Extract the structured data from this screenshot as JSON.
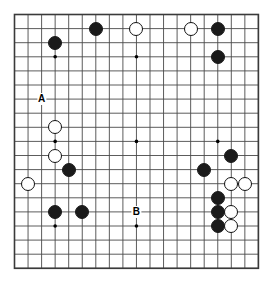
{
  "diagram": {
    "kind": "go-board-diagram",
    "board_size": 19,
    "colors": {
      "background": "#ffffff",
      "grid_line": "#4a4a4a",
      "border_line": "#3a3a3a",
      "black_stone": "#1a1a1a",
      "white_stone": "#ffffff",
      "white_stone_outline": "#111111",
      "label_text": "#000000"
    },
    "geometry": {
      "origin_x": 14.5,
      "origin_y": 14.5,
      "step_x": 13.55,
      "step_y": 14.1,
      "stone_diameter": 14,
      "border_width": 1.6,
      "grid_width": 0.9,
      "star_radius": 1.8
    },
    "star_points": [
      {
        "col": 4,
        "row": 4
      },
      {
        "col": 10,
        "row": 4
      },
      {
        "col": 16,
        "row": 4
      },
      {
        "col": 4,
        "row": 10
      },
      {
        "col": 10,
        "row": 10
      },
      {
        "col": 16,
        "row": 10
      },
      {
        "col": 4,
        "row": 16
      },
      {
        "col": 10,
        "row": 16
      },
      {
        "col": 16,
        "row": 16
      }
    ],
    "stones": [
      {
        "color": "black",
        "col": 7,
        "row": 2
      },
      {
        "color": "white",
        "col": 10,
        "row": 2
      },
      {
        "color": "white",
        "col": 14,
        "row": 2
      },
      {
        "color": "black",
        "col": 16,
        "row": 2
      },
      {
        "color": "black",
        "col": 4,
        "row": 3
      },
      {
        "color": "black",
        "col": 16,
        "row": 4
      },
      {
        "color": "white",
        "col": 4,
        "row": 9
      },
      {
        "color": "white",
        "col": 4,
        "row": 11
      },
      {
        "color": "black",
        "col": 17,
        "row": 11
      },
      {
        "color": "black",
        "col": 5,
        "row": 12
      },
      {
        "color": "black",
        "col": 15,
        "row": 12
      },
      {
        "color": "white",
        "col": 2,
        "row": 13
      },
      {
        "color": "white",
        "col": 17,
        "row": 13
      },
      {
        "color": "white",
        "col": 18,
        "row": 13
      },
      {
        "color": "black",
        "col": 16,
        "row": 14
      },
      {
        "color": "black",
        "col": 4,
        "row": 15
      },
      {
        "color": "black",
        "col": 6,
        "row": 15
      },
      {
        "color": "black",
        "col": 16,
        "row": 15
      },
      {
        "color": "white",
        "col": 17,
        "row": 15
      },
      {
        "color": "black",
        "col": 16,
        "row": 16
      },
      {
        "color": "white",
        "col": 17,
        "row": 16
      }
    ],
    "labels": [
      {
        "text": "A",
        "col": 3,
        "row": 7
      },
      {
        "text": "B",
        "col": 10,
        "row": 15
      }
    ]
  }
}
